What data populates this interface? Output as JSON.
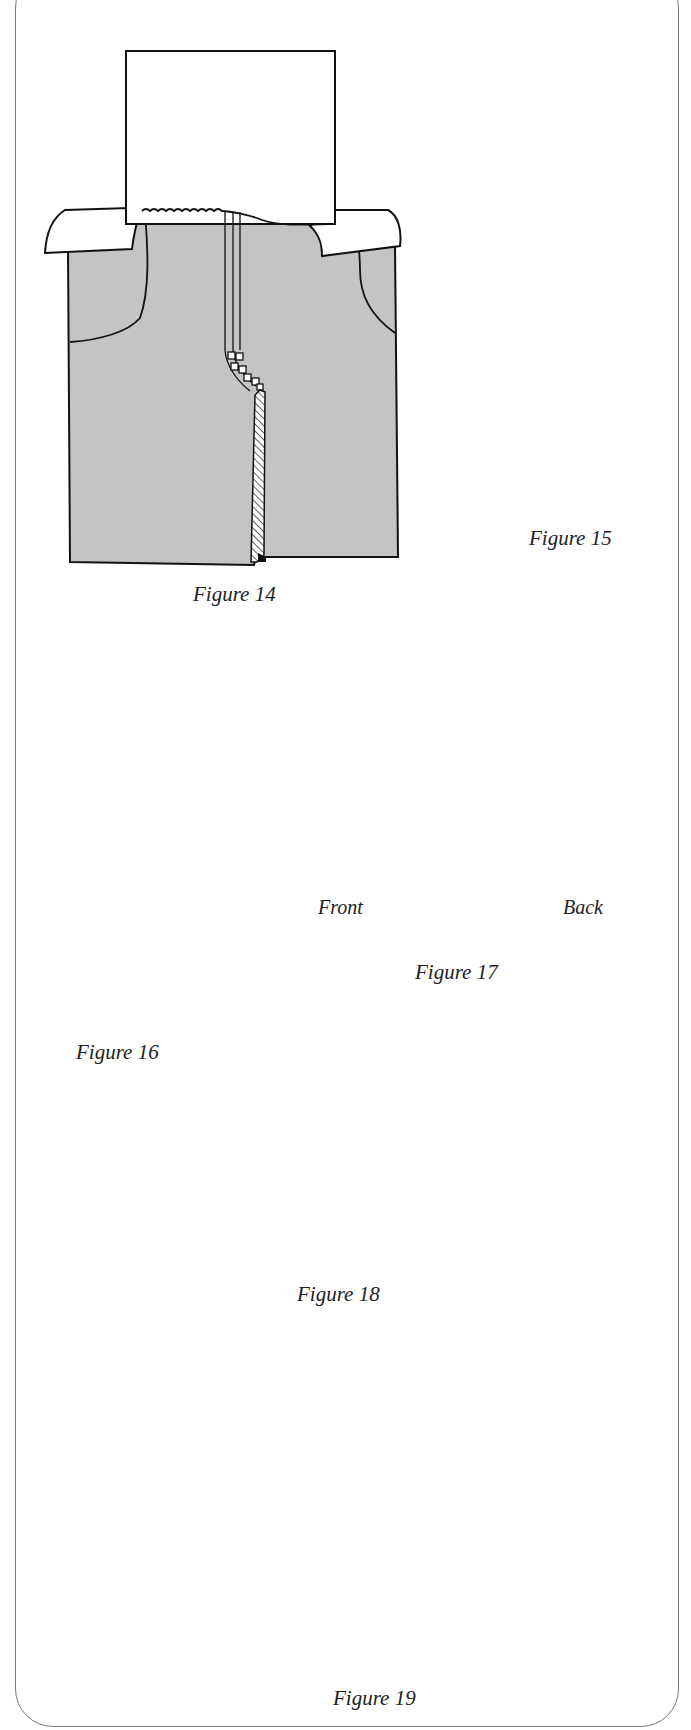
{
  "page": {
    "background": "#ffffff",
    "fabric_color": "#c4c4c4",
    "line_color": "#111111"
  },
  "figures": [
    {
      "id": "figure-14",
      "caption": "Figure 14",
      "description": "Trouser front with waistband facing pinned on top, pockets, and fly seam"
    },
    {
      "id": "figure-15",
      "caption": "Figure 15",
      "description": "Step corner seam with dashed stitching line ending at a dot"
    },
    {
      "id": "figure-16",
      "caption": "Figure 16",
      "description": "Two leg pieces with folded hem extensions and dashed stitch lines"
    },
    {
      "id": "figure-17",
      "caption": "Figure 17",
      "description": "Folded hem with rolled back edge",
      "labels": {
        "left": "Front",
        "right": "Back"
      }
    },
    {
      "id": "figure-18",
      "caption": "Figure 18",
      "description": "Rectangular band piece"
    },
    {
      "id": "figure-19",
      "caption": "Figure 19",
      "description": "Cylindrical leg with stitched hem circle"
    }
  ]
}
